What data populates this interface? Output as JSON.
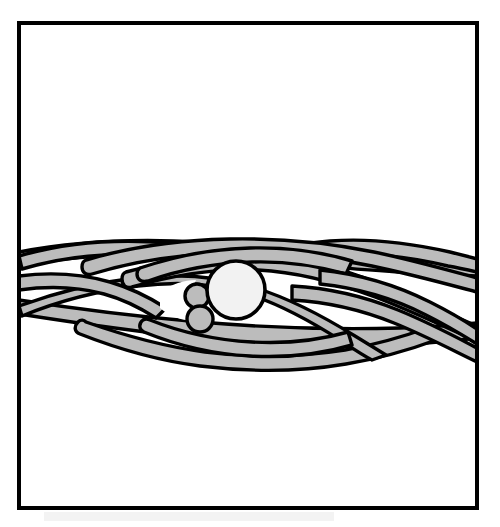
{
  "figure": {
    "title": "Braided Strand Cross Section Figure",
    "style": "patent-line-art",
    "background_color": "#ffffff"
  },
  "colors": {
    "ink": "#000000",
    "strand_fill": "#bcbcbc",
    "core_fill_large": "#f2f2f2",
    "core_fill_small": "#bcbcbc",
    "paper": "#ffffff",
    "void_fill": "#ffffff"
  },
  "frame": {
    "name": "figure-border",
    "x": 19,
    "y": 23,
    "width": 458,
    "height": 485,
    "stroke_width": 4,
    "stroke_color": "#000000"
  },
  "geometry": {
    "strand_stroke_width": 3.4,
    "core_stroke_width": 3.4,
    "band_axis_y": 295,
    "band_top_y": 236,
    "band_bottom_y": 360,
    "left_exit_x": 19,
    "right_exit_x": 477
  },
  "strands": [
    {
      "id": "strand-back-upper-left",
      "label": "Rear upper-left strand",
      "fill": "#bcbcbc",
      "z": 1,
      "path": "M 19,252 C 70,242 130,238 200,242 C 270,246 330,254 400,258 C 430,260 455,261 477,262 L 477,276 C 452,275 428,274 398,272 C 330,268 268,260 198,256 C 130,252 70,256 19,266 Z"
    },
    {
      "id": "strand-back-lower-left",
      "label": "Rear lower-left strand",
      "fill": "#bcbcbc",
      "z": 1,
      "path": "M 19,300 C 70,308 130,316 200,322 C 270,328 330,330 400,328 C 430,327 455,325 477,323 L 477,338 C 452,341 428,343 398,345 C 330,348 268,345 198,338 C 130,331 70,322 19,314 Z"
    },
    {
      "id": "strand-outer-top-arc",
      "label": "Outer top arcing strand",
      "fill": "#bcbcbc",
      "z": 2,
      "path": "M 19,256 C 60,244 110,238 170,243 C 200,246 218,251 240,250 C 268,249 296,244 330,241 C 368,238 410,243 450,252 C 462,255 470,257 477,259 L 477,272 C 468,270 459,268 448,266 C 410,257 370,252 333,255 C 300,258 272,262 243,263 C 218,264 198,259 170,256 C 112,251 62,257 22,269 Z"
    },
    {
      "id": "strand-upper-sweep-right",
      "label": "Upper sweeping strand toward right",
      "fill": "#bcbcbc",
      "z": 3,
      "path": "M 86,260 C 130,247 180,240 230,239 C 285,238 330,243 374,252 C 412,260 444,269 477,278 L 477,292 C 443,283 410,274 372,266 C 329,257 286,252 232,253 C 183,254 134,261 92,274 C 86,276 82,272 82,267 C 82,263 83,261 86,260 Z"
    },
    {
      "id": "strand-mid-diagonal-right",
      "label": "Mid diagonal strand sweeping down-right",
      "fill": "#bcbcbc",
      "z": 4,
      "path": "M 126,272 C 170,260 215,253 258,255 C 300,257 340,268 378,283 C 414,297 446,313 477,326 L 477,341 C 444,327 412,311 375,297 C 338,283 299,272 258,270 C 217,268 174,275 132,287 C 126,289 122,285 122,279 C 122,275 123,273 126,272 Z"
    },
    {
      "id": "strand-lower-diagonal-left",
      "label": "Lower diagonal strand sweeping down-left",
      "fill": "#bcbcbc",
      "z": 4,
      "path": "M 19,306 C 52,294 92,283 135,278 C 178,273 218,276 256,288 C 294,300 326,318 355,336 C 368,344 378,350 386,355 L 372,360 C 362,355 352,348 340,340 C 312,322 282,305 248,294 C 214,283 178,281 138,286 C 96,291 56,302 22,316 Z"
    },
    {
      "id": "strand-bottom-bulge",
      "label": "Bottom bulging strand of braid",
      "fill": "#bcbcbc",
      "z": 3,
      "path": "M 86,322 C 120,334 160,346 205,352 C 252,358 300,357 345,350 C 380,344 408,335 430,327 L 436,340 C 412,349 382,358 346,364 C 299,372 249,372 200,366 C 154,360 113,347 80,334 C 74,332 74,326 78,322 C 81,319 84,320 86,322 Z"
    },
    {
      "id": "strand-right-inner-loop",
      "label": "Right inner looping strand",
      "fill": "#bcbcbc",
      "z": 5,
      "path": "M 292,286 C 330,288 366,297 398,310 C 430,323 456,337 477,348 L 477,362 C 452,350 426,336 394,323 C 362,310 328,302 292,300 Z"
    },
    {
      "id": "strand-right-outer-loop",
      "label": "Right outer looping strand",
      "fill": "#bcbcbc",
      "z": 5,
      "path": "M 320,270 C 360,274 398,286 430,302 C 452,313 468,323 477,329 L 477,344 C 464,336 448,326 426,315 C 395,299 358,288 320,284 Z"
    },
    {
      "id": "strand-left-inner-crossing",
      "label": "Left inner crossing strand",
      "fill": "#bcbcbc",
      "z": 5,
      "path": "M 19,276 C 50,272 82,274 110,282 C 134,289 152,299 166,308 L 156,318 C 142,309 126,300 104,294 C 78,287 48,286 19,290 Z"
    },
    {
      "id": "strand-center-upper-band",
      "label": "Central upper band over the cores",
      "fill": "#bcbcbc",
      "z": 6,
      "path": "M 140,268 C 175,256 212,249 250,248 C 288,247 322,252 352,261 L 346,274 C 318,266 287,261 252,262 C 216,263 182,269 148,281 C 141,283 137,279 137,274 C 137,270 138,269 140,268 Z"
    },
    {
      "id": "strand-center-lower-band",
      "label": "Central lower band under the cores",
      "fill": "#bcbcbc",
      "z": 6,
      "path": "M 150,320 C 180,332 215,340 252,342 C 288,344 320,340 348,332 L 352,345 C 322,354 287,358 250,356 C 212,354 176,345 144,332 C 138,329 139,323 143,320 C 146,318 148,319 150,320 Z"
    }
  ],
  "cores": [
    {
      "id": "core-large",
      "label": "Large core circle",
      "cx": 236,
      "cy": 290,
      "r": 29,
      "fill": "#f2f2f2",
      "stroke": "#000000",
      "stroke_width": 3.6
    },
    {
      "id": "core-small-upper",
      "label": "Upper small core circle",
      "cx": 197,
      "cy": 296,
      "r": 12,
      "fill": "#bcbcbc",
      "stroke": "#000000",
      "stroke_width": 3.4
    },
    {
      "id": "core-small-lower",
      "label": "Lower small core circle",
      "cx": 200,
      "cy": 319,
      "r": 13,
      "fill": "#bcbcbc",
      "stroke": "#000000",
      "stroke_width": 3.4
    }
  ],
  "voids": [
    {
      "id": "void-center-left",
      "label": "White opening left of cores",
      "path": "M 160,292 C 172,284 184,280 196,280 C 190,292 190,308 198,320 C 186,322 172,318 160,308 Z"
    }
  ],
  "artifacts": [
    {
      "id": "scan-smudge-bottom",
      "label": "Faint scan smudge near lower border",
      "x": 44,
      "y": 512,
      "width": 290,
      "height": 9
    }
  ]
}
